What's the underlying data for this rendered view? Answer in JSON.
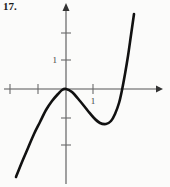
{
  "figure": {
    "label": "17."
  },
  "chart_data": {
    "type": "line",
    "title": "",
    "subtitle": "",
    "xlabel": "",
    "ylabel": "",
    "legend": [],
    "grid": false,
    "axes": {
      "origin_px": {
        "x": 66,
        "y": 89
      },
      "unit_px": 27,
      "x_axis_pixel_range": [
        4,
        162
      ],
      "y_axis_pixel_range": [
        4,
        184
      ],
      "xlim": [
        -2.3,
        3.6
      ],
      "ylim": [
        -3.5,
        3.1
      ],
      "x_arrow": "right",
      "y_arrow": "up"
    },
    "ticks": {
      "x_values": [
        -2,
        -1,
        1
      ],
      "x_pixels": [
        10,
        38,
        93
      ],
      "y_values": [
        1,
        2,
        -1,
        -2
      ],
      "y_pixels": [
        60,
        33,
        118,
        145
      ]
    },
    "tick_labels": [
      {
        "text": "1",
        "axis": "x",
        "value": 1,
        "px": {
          "x": 93,
          "y": 99
        }
      }
    ],
    "curve": {
      "name": "cubic",
      "points_px": [
        {
          "x": 16,
          "y": 177
        },
        {
          "x": 22,
          "y": 162
        },
        {
          "x": 28,
          "y": 148
        },
        {
          "x": 34,
          "y": 134
        },
        {
          "x": 40,
          "y": 122
        },
        {
          "x": 46,
          "y": 110
        },
        {
          "x": 52,
          "y": 101
        },
        {
          "x": 58,
          "y": 94
        },
        {
          "x": 62,
          "y": 90
        },
        {
          "x": 66,
          "y": 89
        },
        {
          "x": 72,
          "y": 92
        },
        {
          "x": 80,
          "y": 101
        },
        {
          "x": 88,
          "y": 111
        },
        {
          "x": 94,
          "y": 118
        },
        {
          "x": 100,
          "y": 123
        },
        {
          "x": 106,
          "y": 124
        },
        {
          "x": 111,
          "y": 121
        },
        {
          "x": 115,
          "y": 114
        },
        {
          "x": 119,
          "y": 103
        },
        {
          "x": 122,
          "y": 90
        },
        {
          "x": 125,
          "y": 74
        },
        {
          "x": 128,
          "y": 56
        },
        {
          "x": 131,
          "y": 35
        },
        {
          "x": 134,
          "y": 14
        }
      ],
      "features": {
        "local_max_px": {
          "x": 66,
          "y": 89
        },
        "local_min_px": {
          "x": 103,
          "y": 124
        },
        "x_intercepts_px": [
          66,
          122
        ],
        "local_max_value": {
          "x": 0,
          "y": 0
        },
        "local_min_value": {
          "x": 1.37,
          "y": -1.3
        },
        "x_intercept_values": [
          0,
          2.07
        ]
      }
    },
    "colors": {
      "curve": "#111111",
      "axis": "#555555",
      "tick": "#6b6b6b",
      "label": "#1a1a1a",
      "background": "#fbfbfa"
    }
  }
}
